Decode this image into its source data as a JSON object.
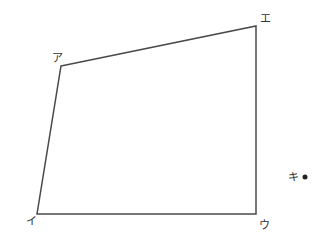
{
  "diagram": {
    "type": "quadrilateral",
    "stroke_color": "#4a4a4a",
    "vertices": [
      {
        "id": "a",
        "label": "ア",
        "x": 61,
        "y": 66,
        "label_x": 52,
        "label_y": 62
      },
      {
        "id": "e",
        "label": "エ",
        "x": 256,
        "y": 26,
        "label_x": 260,
        "label_y": 22
      },
      {
        "id": "u",
        "label": "ウ",
        "x": 256,
        "y": 214,
        "label_x": 259,
        "label_y": 229
      },
      {
        "id": "i",
        "label": "イ",
        "x": 37,
        "y": 214,
        "label_x": 26,
        "label_y": 225
      }
    ],
    "point": {
      "id": "ki",
      "label": "キ",
      "x": 305,
      "y": 177,
      "label_x": 288,
      "label_y": 181
    }
  }
}
